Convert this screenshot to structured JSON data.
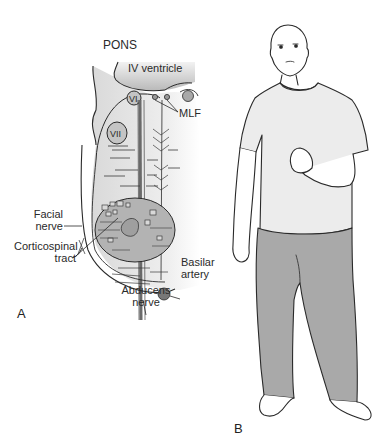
{
  "figure": {
    "panel_a": {
      "panel_label": "A",
      "title": "PONS",
      "labels": {
        "iv_ventricle": "IV ventricle",
        "nucleus_vi": "VI",
        "nucleus_vii": "VII",
        "mlf": "MLF",
        "facial_nerve_line1": "Facial",
        "facial_nerve_line2": "nerve",
        "corticospinal_line1": "Corticospinal",
        "corticospinal_line2": "tract",
        "basilar_line1": "Basilar",
        "basilar_line2": "artery",
        "abducens_line1": "Abducens",
        "abducens_line2": "nerve"
      }
    },
    "panel_b": {
      "panel_label": "B"
    },
    "colors": {
      "line": "#2a2a2a",
      "tissue": "#e4e4e4",
      "ventricle": "#cfcfcf",
      "nucleus": "#b8b8b8",
      "pants": "#a9a9a9",
      "shirt": "#ededed",
      "skin": "#ffffff"
    }
  }
}
